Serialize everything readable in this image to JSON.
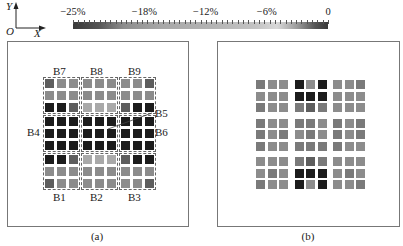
{
  "axes": {
    "origin": "O",
    "x": "X",
    "y": "Y"
  },
  "colorbar": {
    "ticks": [
      {
        "label": "−25%",
        "pos": 0.0
      },
      {
        "label": "−18%",
        "pos": 0.28
      },
      {
        "label": "−12%",
        "pos": 0.52
      },
      {
        "label": "−6%",
        "pos": 0.76
      },
      {
        "label": "0",
        "pos": 1.0
      }
    ]
  },
  "shades": {
    "K": "#1c1c1c",
    "D": "#5e5e5e",
    "G": "#8c8c8c",
    "L": "#a9a9a9",
    "M": "#7a7a7a"
  },
  "panel_a": {
    "caption": "(a)",
    "grid": [
      "DGG GGG GGD",
      "GGG GGG GGG",
      "KKD LLL DKK",
      "KKK KKK KKK",
      "KKK KKK KKK",
      "KKK KKK KKK",
      "KKD LLL DKK",
      "GGG GGG GGG",
      "DGG GGG GGD"
    ],
    "block_labels": [
      {
        "label": "B7",
        "pos": "top-left"
      },
      {
        "label": "B8",
        "pos": "top-center"
      },
      {
        "label": "B9",
        "pos": "top-right"
      },
      {
        "label": "B4",
        "pos": "mid-left"
      },
      {
        "label": "B5",
        "pos": "mid-center-callout"
      },
      {
        "label": "B6",
        "pos": "mid-right"
      },
      {
        "label": "B1",
        "pos": "bottom-left"
      },
      {
        "label": "B2",
        "pos": "bottom-center"
      },
      {
        "label": "B3",
        "pos": "bottom-right"
      }
    ]
  },
  "panel_b": {
    "caption": "(b)",
    "grid": [
      "MGG KGK GGM",
      "GGG KKK GGG",
      "MGG MDM GGG",
      "MGG MMG MGM",
      "MGM GMG MGM",
      "MGG MMM MGG",
      "GGG MDM GGG",
      "GMG KKK GMG",
      "MGG KGK GGM"
    ]
  }
}
